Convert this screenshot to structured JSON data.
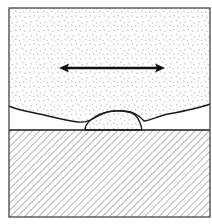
{
  "diagram": {
    "regions": [
      {
        "name": "upper-stippled-layer",
        "fill": "stipple",
        "color": "#8a8a8a"
      },
      {
        "name": "clear-gap-layer",
        "fill": "none",
        "color": "#ffffff"
      },
      {
        "name": "lens-deposit",
        "fill": "stipple",
        "color": "#8a8a8a"
      },
      {
        "name": "substrate",
        "fill": "diagonal-hatch",
        "color": "#7a7a7a"
      }
    ],
    "arrow": {
      "type": "double-headed",
      "orientation": "horizontal",
      "x1": 60,
      "x2": 164,
      "y": 68
    },
    "interface_line_y": 130,
    "stroke_color": "#1a1a1a",
    "border_color": "#444444"
  }
}
